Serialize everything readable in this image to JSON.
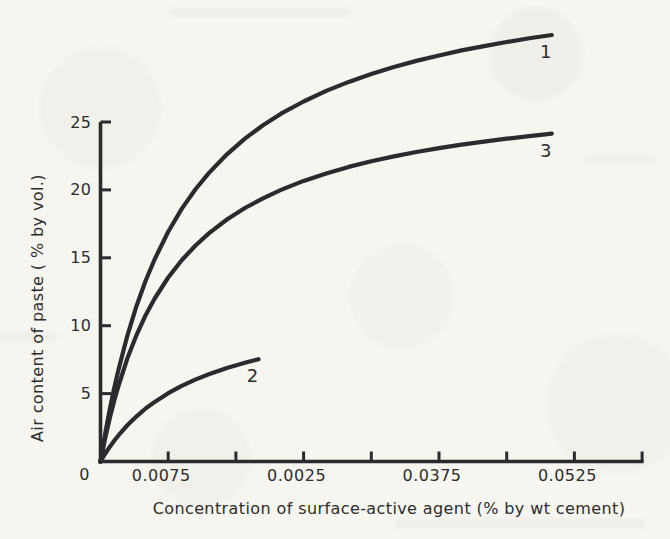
{
  "figure": {
    "ink_color": "#2b2b2b",
    "paper_color": "#f6f5f0"
  },
  "chart_data": {
    "type": "line",
    "title": "",
    "xlabel": "Concentration of surface-active agent (% by wt cement)",
    "ylabel": "Air content of paste ( % by vol.)",
    "xlim": [
      0,
      0.06
    ],
    "ylim": [
      0,
      25
    ],
    "grid": false,
    "legend_position": "curve-end-labels",
    "origin_label": "0",
    "x_ticks": [
      {
        "value": 0.0075,
        "label": "0.0075"
      },
      {
        "value": 0.015,
        "label": ""
      },
      {
        "value": 0.0225,
        "label": "0.0025"
      },
      {
        "value": 0.03,
        "label": ""
      },
      {
        "value": 0.0375,
        "label": "0.0375"
      },
      {
        "value": 0.045,
        "label": ""
      },
      {
        "value": 0.0525,
        "label": "0.0525"
      },
      {
        "value": 0.06,
        "label": ""
      }
    ],
    "y_ticks": [
      {
        "value": 5,
        "label": "5"
      },
      {
        "value": 10,
        "label": "10"
      },
      {
        "value": 15,
        "label": "15"
      },
      {
        "value": 20,
        "label": "20"
      },
      {
        "value": 25,
        "label": "25"
      }
    ],
    "series": [
      {
        "name": "1",
        "label": "1",
        "x": [
          0,
          0.0005,
          0.001,
          0.0015,
          0.002,
          0.003,
          0.004,
          0.005,
          0.006,
          0.0075,
          0.009,
          0.0105,
          0.012,
          0.014,
          0.016,
          0.018,
          0.02,
          0.0225,
          0.025,
          0.0275,
          0.03,
          0.0325,
          0.035,
          0.0375,
          0.04,
          0.0425,
          0.045,
          0.0475,
          0.05
        ],
        "y": [
          0,
          1.97,
          3.74,
          5.34,
          6.79,
          9.33,
          11.47,
          13.31,
          14.9,
          16.92,
          18.6,
          20.03,
          21.24,
          22.62,
          23.78,
          24.76,
          25.61,
          26.51,
          27.29,
          27.95,
          28.53,
          29.05,
          29.5,
          29.9,
          30.27,
          30.59,
          30.89,
          31.16,
          31.41
        ]
      },
      {
        "name": "3",
        "label": "3",
        "x": [
          0,
          0.0005,
          0.001,
          0.0015,
          0.002,
          0.003,
          0.004,
          0.005,
          0.006,
          0.0075,
          0.009,
          0.0105,
          0.012,
          0.014,
          0.016,
          0.018,
          0.02,
          0.0225,
          0.025,
          0.0275,
          0.03,
          0.0325,
          0.035,
          0.0375,
          0.04,
          0.0425,
          0.045,
          0.0475,
          0.05
        ],
        "y": [
          0,
          1.65,
          3.11,
          4.42,
          5.6,
          7.64,
          9.33,
          10.77,
          12.0,
          13.55,
          14.82,
          15.89,
          16.8,
          17.82,
          18.67,
          19.38,
          20.0,
          20.66,
          21.21,
          21.69,
          22.11,
          22.47,
          22.79,
          23.08,
          23.33,
          23.56,
          23.77,
          23.96,
          24.14
        ]
      },
      {
        "name": "2",
        "label": "2",
        "x": [
          0,
          0.0005,
          0.001,
          0.0015,
          0.002,
          0.003,
          0.004,
          0.005,
          0.006,
          0.0075,
          0.009,
          0.0105,
          0.012,
          0.014,
          0.016,
          0.0175
        ],
        "y": [
          0,
          0.55,
          1.05,
          1.51,
          1.94,
          2.69,
          3.33,
          3.9,
          4.39,
          5.03,
          5.57,
          6.03,
          6.43,
          6.89,
          7.27,
          7.53
        ]
      }
    ]
  }
}
